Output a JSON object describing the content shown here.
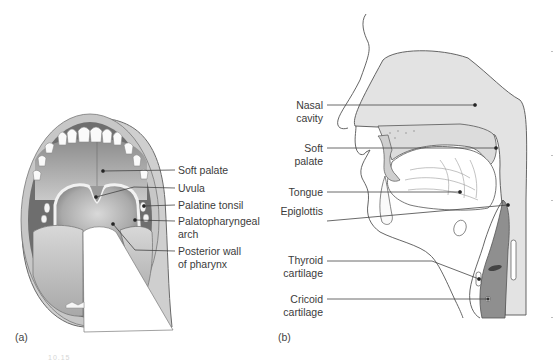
{
  "figure": {
    "panel_a": {
      "tag": "(a)",
      "title": "Open mouth, anterior view",
      "labels": [
        {
          "text": "Soft palate"
        },
        {
          "text": "Uvula"
        },
        {
          "text": "Palatine tonsil"
        },
        {
          "text": "Palatopharyngeal",
          "line2": "arch"
        },
        {
          "text": "Posterior wall",
          "line2": "of pharynx"
        }
      ]
    },
    "panel_b": {
      "tag": "(b)",
      "title": "Sagittal section of head and neck",
      "labels": [
        {
          "text": "Nasal",
          "line2": "cavity"
        },
        {
          "text": "Soft",
          "line2": "palate"
        },
        {
          "text": "Tongue"
        },
        {
          "text": "Epiglottis"
        },
        {
          "text": "Thyroid",
          "line2": "cartilage"
        },
        {
          "text": "Cricoid",
          "line2": "cartilage"
        }
      ]
    },
    "caption_fragment": "10.15",
    "colors": {
      "tissue_light": "#e2e2e2",
      "tissue_mid": "#b9b9b9",
      "trachea_dark": "#8f8f8f",
      "outline": "#555555",
      "leader_line": "#444444"
    }
  }
}
